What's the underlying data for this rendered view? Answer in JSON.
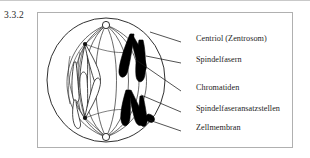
{
  "figure": {
    "number": "3.3.2",
    "caption_language": "de"
  },
  "labels": [
    {
      "id": "centriol",
      "text": "Centriol (Zentrosom)",
      "x": 196,
      "y": 40,
      "leader": {
        "x1": 181,
        "y1": 42,
        "x2": 150,
        "y2": 32
      }
    },
    {
      "id": "spindelfasern",
      "text": "Spindelfasern",
      "x": 196,
      "y": 61,
      "leader": {
        "x1": 181,
        "y1": 63,
        "x2": 146,
        "y2": 56
      }
    },
    {
      "id": "chromatiden",
      "text": "Chromatiden",
      "x": 196,
      "y": 89,
      "leader": {
        "x1": 181,
        "y1": 91,
        "x2": 136,
        "y2": 60
      }
    },
    {
      "id": "ansatzstellen",
      "text": "Spindelfaseransatzstellen",
      "x": 196,
      "y": 110,
      "leader": {
        "x1": 181,
        "y1": 112,
        "x2": 141,
        "y2": 95
      }
    },
    {
      "id": "zellmembran",
      "text": "Zellmembran",
      "x": 196,
      "y": 129,
      "leader": {
        "x1": 181,
        "y1": 131,
        "x2": 149,
        "y2": 120
      }
    }
  ],
  "diagram": {
    "name": "mitosis-cell-diagram",
    "cell_membrane": {
      "cx": 106,
      "cy": 80,
      "rx": 59,
      "ry": 62
    },
    "centrioles": [
      {
        "name": "top-centriole",
        "cx": 106,
        "cy": 25,
        "r": 3.6
      },
      {
        "name": "bottom-centriole",
        "cx": 106,
        "cy": 137,
        "r": 3.6
      }
    ],
    "attachment_points": [
      {
        "name": "upper-attachment",
        "cx": 85,
        "cy": 44
      },
      {
        "name": "lower-attachment",
        "cx": 85,
        "cy": 118
      }
    ],
    "chromatid_sets": [
      {
        "name": "light-chromatids",
        "fill": "#ffffff",
        "stroke": "#1a1a1a",
        "side": "left"
      },
      {
        "name": "dark-chromatids",
        "fill": "#000000",
        "stroke": "#000000",
        "side": "right"
      }
    ]
  },
  "colors": {
    "frame": "#b0b0b0",
    "ink": "#1a1a1a",
    "chromatid_dark": "#000000",
    "page": "#ffffff"
  }
}
